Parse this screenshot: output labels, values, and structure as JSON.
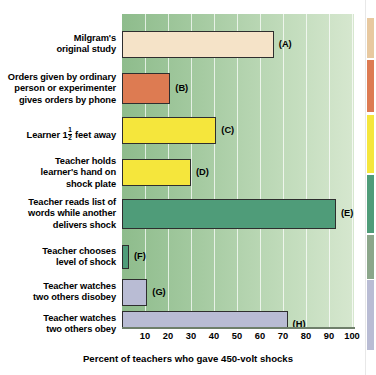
{
  "chart_data": {
    "type": "bar",
    "orientation": "horizontal",
    "title": "",
    "xlabel": "Percent of teachers who gave 450-volt shocks",
    "ylabel": "",
    "xlim": [
      0,
      100
    ],
    "xticks": [
      10,
      20,
      30,
      40,
      50,
      60,
      70,
      80,
      90,
      100
    ],
    "grid": true,
    "legend": "none",
    "categories": [
      "Milgram's original study",
      "Orders given by ordinary person or experimenter gives orders by phone",
      "Learner 1 1/2 feet away",
      "Teacher holds learner's hand on shock plate",
      "Teacher reads list of words while another delivers shock",
      "Teacher chooses level of shock",
      "Teacher watches two others disobey",
      "Teacher watches two others obey"
    ],
    "values": [
      66,
      21,
      41,
      30,
      93,
      3,
      11,
      72
    ],
    "point_labels": [
      "(A)",
      "(B)",
      "(C)",
      "(D)",
      "(E)",
      "(F)",
      "(G)",
      "(H)"
    ],
    "bar_colors": [
      "#f5e3c8",
      "#dd7b52",
      "#f5e63c",
      "#f5e63c",
      "#4f9c79",
      "#4f9c79",
      "#b9bcd4",
      "#b9bcd4"
    ]
  },
  "bars": [
    {
      "tag": "(A)",
      "value": 66,
      "color": "#f5e3c8",
      "label_lines": [
        "Milgram's",
        "original study"
      ]
    },
    {
      "tag": "(B)",
      "value": 21,
      "color": "#dd7b52",
      "label_lines": [
        "Orders given by ordinary",
        "person or experimenter",
        "gives orders by phone"
      ]
    },
    {
      "tag": "(C)",
      "value": 41,
      "color": "#f5e63c",
      "label_lines": [
        "Learner 1½ feet away"
      ]
    },
    {
      "tag": "(D)",
      "value": 30,
      "color": "#f5e63c",
      "label_lines": [
        "Teacher holds",
        "learner's hand on",
        "shock plate"
      ]
    },
    {
      "tag": "(E)",
      "value": 93,
      "color": "#4f9c79",
      "label_lines": [
        "Teacher reads list of",
        "words while another",
        "delivers shock"
      ]
    },
    {
      "tag": "(F)",
      "value": 3,
      "color": "#4f9c79",
      "label_lines": [
        "Teacher chooses",
        "level of shock"
      ]
    },
    {
      "tag": "(G)",
      "value": 11,
      "color": "#b9bcd4",
      "label_lines": [
        "Teacher watches",
        "two others disobey"
      ]
    },
    {
      "tag": "(H)",
      "value": 72,
      "color": "#b9bcd4",
      "label_lines": [
        "Teacher watches",
        "two others obey"
      ]
    }
  ],
  "axis": {
    "xlabel": "Percent of teachers who gave 450-volt shocks",
    "ticks": [
      "10",
      "20",
      "30",
      "40",
      "50",
      "60",
      "70",
      "80",
      "90",
      "100"
    ]
  },
  "learner_label": {
    "prefix": "Learner 1",
    "numerator": "1",
    "denominator": "2",
    "suffix": " feet away"
  },
  "color_key": [
    "#e8c9a0",
    "#dd7b52",
    "#f5e63c",
    "#4f9c79",
    "#8ba68a",
    "#b9bcd4"
  ]
}
